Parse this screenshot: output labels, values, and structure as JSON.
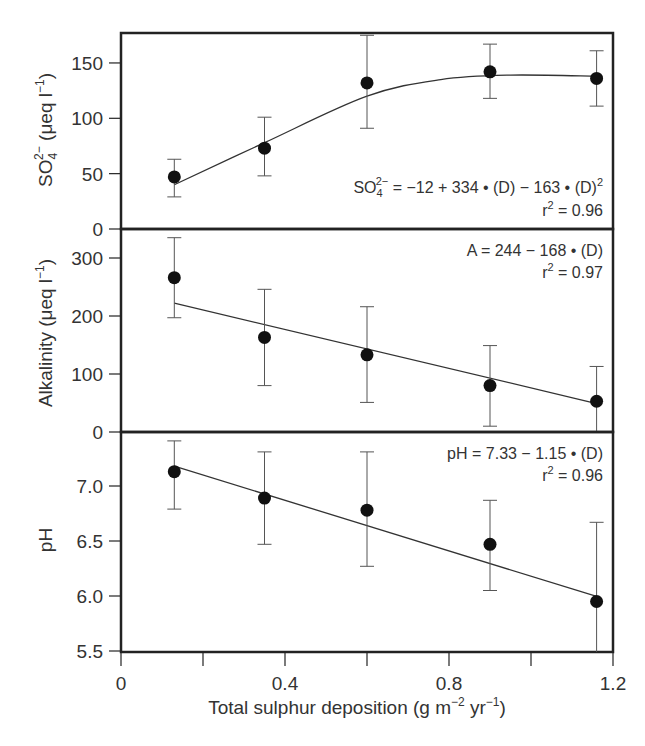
{
  "chart_data": {
    "type": "scatter",
    "xlabel": "Total sulphur deposition (g m⁻² yr⁻¹)",
    "xlim": [
      0,
      1.2
    ],
    "xticks": [
      0,
      0.4,
      0.8,
      1.2
    ],
    "xtick_labels": [
      "0",
      "0.4",
      "0.8",
      "1.2"
    ],
    "x": [
      0.13,
      0.35,
      0.6,
      0.9,
      1.16
    ],
    "panels": [
      {
        "name": "sulphate",
        "ylabel": "SO₄²⁻ (μeq l⁻¹)",
        "ylim": [
          0,
          175
        ],
        "yticks": [
          0,
          50,
          100,
          150
        ],
        "ytick_labels": [
          "0",
          "50",
          "100",
          "150"
        ],
        "values": [
          47,
          73,
          132,
          142,
          136
        ],
        "err_low": [
          29,
          48,
          91,
          118,
          111
        ],
        "err_high": [
          63,
          101,
          175,
          167,
          161
        ],
        "fit": "quadratic",
        "equation": "SO₄²⁻ = −12 + 334 • (D) − 163 • (D)²",
        "r2": "r² = 0.96"
      },
      {
        "name": "alkalinity",
        "ylabel": "Alkalinity (μeq l⁻¹)",
        "ylim": [
          0,
          350
        ],
        "yticks": [
          0,
          100,
          200,
          300
        ],
        "ytick_labels": [
          "0",
          "100",
          "200",
          "300"
        ],
        "values": [
          266,
          163,
          133,
          80,
          53
        ],
        "err_low": [
          197,
          80,
          51,
          10,
          0
        ],
        "err_high": [
          335,
          246,
          216,
          149,
          113
        ],
        "fit": "linear",
        "equation": "A = 244 − 168 • (D)",
        "r2": "r² = 0.97"
      },
      {
        "name": "ph",
        "ylabel": "pH",
        "ylim": [
          5.5,
          7.5
        ],
        "yticks": [
          5.5,
          6.0,
          6.5,
          7.0
        ],
        "ytick_labels": [
          "5.5",
          "6.0",
          "6.5",
          "7.0"
        ],
        "values": [
          7.13,
          6.89,
          6.78,
          6.47,
          5.95
        ],
        "err_low": [
          6.79,
          6.47,
          6.27,
          6.05,
          5.45
        ],
        "err_high": [
          7.41,
          7.31,
          7.31,
          6.87,
          6.67
        ],
        "fit": "linear",
        "equation": "pH = 7.33 − 1.15 • (D)",
        "r2": "r² = 0.96"
      }
    ]
  },
  "labels": {
    "xlabel": "Total sulphur deposition (g m",
    "xlabel_sup1": "−2",
    "xlabel_mid": " yr",
    "xlabel_sup2": "−1",
    "xlabel_end": ")",
    "so4_eq_a": "SO",
    "so4_eq_sub": "4",
    "so4_eq_sup": "2−",
    "so4_eq_b": " = −12 + 334 • (D) − 163 • (D)",
    "so4_eq_sup2": "2",
    "so4_r2_r": "r",
    "so4_r2_sup": "2",
    "so4_r2_val": " = 0.96",
    "alk_eq": "A = 244 − 168 • (D)",
    "alk_r2_r": "r",
    "alk_r2_sup": "2",
    "alk_r2_val": " = 0.97",
    "ph_eq": "pH = 7.33 − 1.15 • (D)",
    "ph_r2_r": "r",
    "ph_r2_sup": "2",
    "ph_r2_val": " = 0.96",
    "so4_ylabel_a": "SO",
    "so4_ylabel_sub": "4",
    "so4_ylabel_sup": "2−",
    "so4_ylabel_b": " (μeq l",
    "so4_ylabel_sup2": "−1",
    "so4_ylabel_c": ")",
    "alk_ylabel_a": "Alkalinity (μeq l",
    "alk_ylabel_sup": "−1",
    "alk_ylabel_b": ")",
    "ph_ylabel": "pH"
  }
}
